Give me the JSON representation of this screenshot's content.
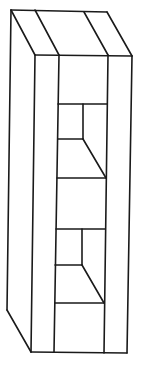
{
  "diagram": {
    "title": "",
    "stroke_color": "#1a1a1a",
    "background_color": "#ffffff",
    "parts": [
      "top-face",
      "left-side-panel",
      "front-left-stile",
      "front-right-stile",
      "upper-shelf-compartment",
      "lower-shelf-compartment"
    ]
  }
}
